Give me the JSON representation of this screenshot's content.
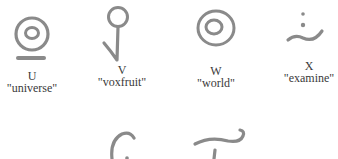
{
  "glyphs": [
    {
      "letter": "U",
      "word": "\"universe\"",
      "icon": "concentric-circles-with-underline-icon"
    },
    {
      "letter": "V",
      "word": "\"voxfruit\"",
      "icon": "circle-on-stem-with-hook-icon"
    },
    {
      "letter": "W",
      "word": "\"world\"",
      "icon": "concentric-circles-icon"
    },
    {
      "letter": "X",
      "word": "\"examine\"",
      "icon": "two-dots-over-wave-icon"
    }
  ],
  "partial_glyphs": [
    {
      "icon": "curl-partial-icon"
    },
    {
      "icon": "t-shape-partial-icon"
    }
  ],
  "colors": {
    "stroke": "#8a8a8a",
    "text": "#3a3a3a",
    "background": "#ffffff"
  }
}
